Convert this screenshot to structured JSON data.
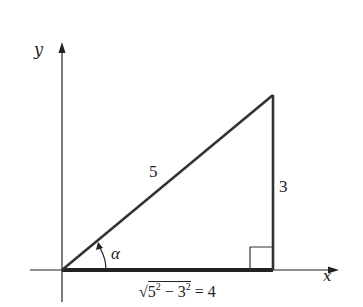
{
  "diagram": {
    "axes": {
      "x_label": "x",
      "y_label": "y"
    },
    "triangle": {
      "hypotenuse_label": "5",
      "opposite_label": "3",
      "adjacent_label_radicand_a": "5",
      "adjacent_label_radicand_b": "3",
      "adjacent_label_exp": "2",
      "adjacent_label_minus": " − ",
      "adjacent_label_result": " = 4",
      "angle_label": "α",
      "right_angle_marker": true
    },
    "colors": {
      "line": "#222222",
      "background": "#ffffff"
    }
  }
}
